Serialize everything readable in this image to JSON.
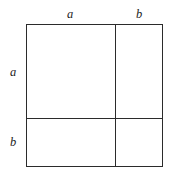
{
  "figure": {
    "type": "geometric-diagram",
    "background_color": "#ffffff",
    "line_color": "#2b2b2b"
  },
  "labels": {
    "top_left": "a",
    "top_right": "b",
    "side_upper": "a",
    "side_lower": "b"
  },
  "chart_data": {
    "type": "diagram",
    "title": "",
    "segments_horizontal": [
      {
        "label": "a",
        "position": "top",
        "fraction": 0.65
      },
      {
        "label": "b",
        "position": "top",
        "fraction": 0.35
      }
    ],
    "segments_vertical": [
      {
        "label": "a",
        "position": "left",
        "fraction": 0.657
      },
      {
        "label": "b",
        "position": "left",
        "fraction": 0.343
      }
    ],
    "cells": [
      {
        "row": "a",
        "col": "a",
        "area": "a^2"
      },
      {
        "row": "a",
        "col": "b",
        "area": "ab"
      },
      {
        "row": "b",
        "col": "a",
        "area": "ab"
      },
      {
        "row": "b",
        "col": "b",
        "area": "b^2"
      }
    ]
  }
}
